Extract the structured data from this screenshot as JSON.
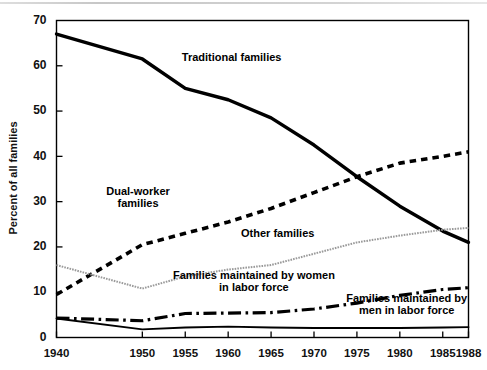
{
  "chart_data": {
    "type": "line",
    "title": "",
    "xlabel": "",
    "ylabel": "Percent of all families",
    "x": [
      1940,
      1950,
      1955,
      1960,
      1965,
      1970,
      1975,
      1980,
      1985,
      1988
    ],
    "xtick_labels": [
      "1940",
      "1950",
      "1955",
      "1960",
      "1965",
      "1970",
      "1975",
      "1980",
      "1985",
      "1988"
    ],
    "ytick_labels": [
      "0",
      "10",
      "20",
      "30",
      "40",
      "50",
      "60",
      "70"
    ],
    "yticks": [
      0,
      10,
      20,
      30,
      40,
      50,
      60,
      70
    ],
    "ylim": [
      0,
      70
    ],
    "xlim": [
      1940,
      1988
    ],
    "grid": false,
    "legend_position": "inline-annotations",
    "series": [
      {
        "name": "Traditional families",
        "style": "thick-solid",
        "color": "#000000",
        "values": [
          67.0,
          61.5,
          55.0,
          52.5,
          48.5,
          42.5,
          35.5,
          29.0,
          23.5,
          21.0
        ]
      },
      {
        "name": "Dual-worker families",
        "style": "thick-dashed",
        "color": "#000000",
        "values": [
          9.5,
          20.5,
          23.0,
          25.5,
          28.5,
          32.0,
          35.5,
          38.5,
          40.0,
          41.0
        ]
      },
      {
        "name": "Other families",
        "style": "thin-gray",
        "color": "#9a9a9a",
        "values": [
          16.0,
          10.8,
          13.5,
          15.0,
          16.0,
          18.5,
          21.0,
          22.5,
          23.8,
          24.2
        ]
      },
      {
        "name": "Families maintained by women in labor force",
        "style": "dash-dot",
        "color": "#000000",
        "values": [
          4.3,
          3.7,
          5.3,
          5.4,
          5.5,
          6.3,
          7.6,
          9.3,
          10.6,
          11.0
        ]
      },
      {
        "name": "Families maintained by men in labor force",
        "style": "thin-solid",
        "color": "#000000",
        "values": [
          4.2,
          1.8,
          2.2,
          2.4,
          2.2,
          2.1,
          2.1,
          2.1,
          2.2,
          2.3
        ]
      }
    ],
    "annotations": [
      {
        "text": "Traditional families",
        "x": 1954.6,
        "y": 61.0
      },
      {
        "text_line1": "Dual-worker",
        "text_line2": "families",
        "x": 1949.5,
        "y": 31.5
      },
      {
        "text": "Other families",
        "x": 1961.5,
        "y": 22.3
      },
      {
        "text_line1": "Families maintained by women",
        "text_line2": "in labor force",
        "x": 1963.0,
        "y": 13.0
      },
      {
        "text_line1": "Families maintained by",
        "text_line2": "men in labor force",
        "x": 1980.8,
        "y": 7.8
      }
    ]
  },
  "axis": {
    "y_title": "Percent of all families"
  }
}
